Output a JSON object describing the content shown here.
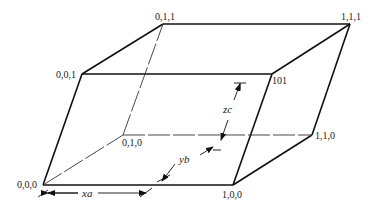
{
  "diagram": {
    "type": "unit-cell-parallelepiped",
    "vertices": {
      "v000": {
        "label": "0,0,0",
        "x": 43,
        "y": 185
      },
      "v100": {
        "label": "1,0,0",
        "x": 233,
        "y": 185
      },
      "v010": {
        "label": "0,1,0",
        "x": 123,
        "y": 135
      },
      "v110": {
        "label": "1,1,0",
        "x": 312,
        "y": 135
      },
      "v001": {
        "label": "0,0,1",
        "x": 82,
        "y": 74
      },
      "v101": {
        "label": "101",
        "x": 272,
        "y": 74
      },
      "v011": {
        "label": "0,1,1",
        "x": 163,
        "y": 24
      },
      "v111": {
        "label": "1,1,1",
        "x": 350,
        "y": 24
      }
    },
    "hidden_edges": [
      "v000-v010",
      "v010-v110",
      "v010-v011"
    ],
    "dimensions": {
      "x": {
        "label": "xa"
      },
      "y": {
        "label": "yb"
      },
      "z": {
        "label": "zc"
      }
    }
  }
}
